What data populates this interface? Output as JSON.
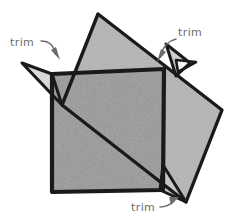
{
  "figure": {
    "background_color": "#ffffff",
    "ink_color": "#1a1a1a",
    "shade_color": "#adadad",
    "label_color": "#6b6b6b",
    "width": 235,
    "height": 221
  },
  "shapes": {
    "upright_square": {
      "name": "upright-square",
      "points": "52,74 164,69 163,190 52,192",
      "fill": "#a8a8a8"
    },
    "tilted_square": {
      "name": "tilted-square",
      "points": "98,14 222,110 186,202 62,105",
      "fill": "#bdbdbd"
    },
    "trim_spike_left": {
      "name": "trim-spike-left",
      "points": "22,63 62,105 52,74"
    },
    "trim_spike_top_right": {
      "name": "trim-spike-top-right",
      "points": "166,44 176,76 190,63"
    },
    "trim_spike_top_right_wing": {
      "name": "trim-spike-top-right-wing",
      "points": "176,60 196,62 178,72"
    },
    "trim_spike_bottom": {
      "name": "trim-spike-bottom",
      "points": "163,165 186,202 160,190"
    }
  },
  "labels": [
    {
      "id": "trim-label-left",
      "text": "trim",
      "x": 10,
      "y": 46,
      "arrow_path": "M 41,41 C 50,41 54,46 55,54",
      "arrow_head": "51,50 60,60 56,47"
    },
    {
      "id": "trim-label-top-right",
      "text": "trim",
      "x": 178,
      "y": 36,
      "arrow_path": "M 176,39 C 168,41 163,47 161,55",
      "arrow_head": "166,52 157,62 161,49"
    },
    {
      "id": "trim-label-bottom",
      "text": "trim",
      "x": 131,
      "y": 211,
      "arrow_path": "M 160,207 C 166,207 170,205 174,201",
      "arrow_head": "169,197 179,197 171,205"
    }
  ]
}
